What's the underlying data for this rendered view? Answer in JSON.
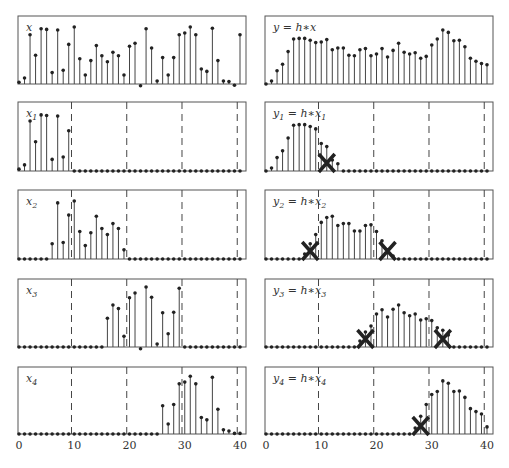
{
  "figure": {
    "x_ticks": [
      "0",
      "10",
      "20",
      "30",
      "40"
    ],
    "x_range": [
      0,
      40
    ],
    "block_boundaries": [
      9.5,
      19.5,
      29.5,
      39.5
    ]
  },
  "panels": {
    "left": [
      {
        "label": "x",
        "sub": ""
      },
      {
        "label": "x",
        "sub": "1"
      },
      {
        "label": "x",
        "sub": "2"
      },
      {
        "label": "x",
        "sub": "3"
      },
      {
        "label": "x",
        "sub": "4"
      }
    ],
    "right": [
      {
        "label": "y = h∗x",
        "sub": ""
      },
      {
        "label": "y",
        "sub": "1",
        "rhs": " = h∗x",
        "rhs_sub": "1"
      },
      {
        "label": "y",
        "sub": "2",
        "rhs": " = h∗x",
        "rhs_sub": "2"
      },
      {
        "label": "y",
        "sub": "3",
        "rhs": " = h∗x",
        "rhs_sub": "3"
      },
      {
        "label": "y",
        "sub": "4",
        "rhs": " = h∗x",
        "rhs_sub": "4"
      }
    ]
  },
  "chart_data": [
    {
      "type": "stem",
      "title": "x",
      "x_range": [
        0,
        40
      ],
      "values": [
        0.03,
        0.1,
        0.82,
        0.48,
        0.92,
        0.91,
        0.19,
        0.9,
        0.23,
        0.66,
        0.95,
        0.42,
        0.15,
        0.39,
        0.64,
        0.47,
        0.37,
        0.53,
        0.47,
        0.15,
        0.63,
        0.68,
        -0.03,
        0.92,
        0.6,
        0.05,
        0.44,
        0.15,
        0.44,
        0.82,
        0.85,
        0.95,
        0.82,
        0.25,
        0.21,
        0.93,
        0.39,
        0.05,
        0.04,
        -0.02,
        0.82
      ]
    },
    {
      "type": "stem",
      "title": "y = h∗x",
      "x_range": [
        0,
        40
      ],
      "values": [
        0.0,
        0.05,
        0.22,
        0.33,
        0.54,
        0.75,
        0.76,
        0.76,
        0.73,
        0.69,
        0.7,
        0.74,
        0.57,
        0.6,
        0.6,
        0.48,
        0.47,
        0.57,
        0.59,
        0.47,
        0.5,
        0.59,
        0.45,
        0.56,
        0.68,
        0.53,
        0.5,
        0.52,
        0.43,
        0.46,
        0.65,
        0.75,
        0.9,
        0.86,
        0.72,
        0.73,
        0.62,
        0.43,
        0.38,
        0.34,
        0.32
      ]
    },
    {
      "type": "stem",
      "title": "x1",
      "boundaries": [
        9.5,
        19.5,
        29.5,
        39.5
      ],
      "values": [
        0.03,
        0.1,
        0.82,
        0.48,
        0.92,
        0.91,
        0.19,
        0.9,
        0.23,
        0.66,
        0,
        0,
        0,
        0,
        0,
        0,
        0,
        0,
        0,
        0,
        0,
        0,
        0,
        0,
        0,
        0,
        0,
        0,
        0,
        0,
        0,
        0,
        0,
        0,
        0,
        0,
        0,
        0,
        0,
        0,
        0
      ]
    },
    {
      "type": "stem",
      "title": "y1 = h∗x1",
      "crossed": [
        11
      ],
      "values": [
        0.0,
        0.05,
        0.22,
        0.33,
        0.54,
        0.75,
        0.76,
        0.76,
        0.73,
        0.69,
        0.45,
        0.4,
        0.18,
        0.12,
        0,
        0,
        0,
        0,
        0,
        0,
        0,
        0,
        0,
        0,
        0,
        0,
        0,
        0,
        0,
        0,
        0,
        0,
        0,
        0,
        0,
        0,
        0,
        0,
        0,
        0,
        0
      ]
    },
    {
      "type": "stem",
      "title": "x2",
      "boundaries": [
        9.5,
        19.5,
        29.5,
        39.5
      ],
      "values": [
        0,
        0,
        0,
        0,
        0,
        0,
        0.25,
        0.92,
        0.27,
        0.72,
        0.95,
        0.45,
        0.22,
        0.43,
        0.7,
        0.5,
        0.4,
        0.58,
        0.5,
        0.15,
        0,
        0,
        0,
        0,
        0,
        0,
        0,
        0,
        0,
        0,
        0,
        0,
        0,
        0,
        0,
        0,
        0,
        0,
        0,
        0,
        0
      ]
    },
    {
      "type": "stem",
      "title": "y2 = h∗x2",
      "crossed": [
        8,
        22
      ],
      "values": [
        0,
        0,
        0,
        0,
        0,
        0,
        0,
        0.08,
        0.25,
        0.4,
        0.6,
        0.68,
        0.7,
        0.55,
        0.58,
        0.58,
        0.46,
        0.46,
        0.55,
        0.56,
        0.45,
        0.3,
        0.15,
        0.05,
        0,
        0,
        0,
        0,
        0,
        0,
        0,
        0,
        0,
        0,
        0,
        0,
        0,
        0,
        0,
        0,
        0
      ]
    },
    {
      "type": "stem",
      "title": "x3",
      "boundaries": [
        9.5,
        19.5,
        29.5,
        39.5
      ],
      "values": [
        0,
        0,
        0,
        0,
        0,
        0,
        0,
        0,
        0,
        0,
        0,
        0,
        0,
        0,
        0,
        0,
        0.48,
        0.7,
        0.64,
        0.18,
        0.82,
        0.9,
        -0.03,
        1.0,
        0.83,
        0.05,
        0.57,
        0.22,
        0.58,
        0.98,
        0,
        0,
        0,
        0,
        0,
        0,
        0,
        0,
        0,
        0,
        0
      ]
    },
    {
      "type": "stem",
      "title": "y3 = h∗x3",
      "crossed": [
        18,
        32
      ],
      "values": [
        0,
        0,
        0,
        0,
        0,
        0,
        0,
        0,
        0,
        0,
        0,
        0,
        0,
        0,
        0,
        0,
        0,
        0.1,
        0.25,
        0.35,
        0.55,
        0.62,
        0.5,
        0.63,
        0.7,
        0.57,
        0.52,
        0.55,
        0.45,
        0.47,
        0.44,
        0.32,
        0.28,
        0.2,
        0,
        0,
        0,
        0,
        0,
        0,
        0
      ]
    },
    {
      "type": "stem",
      "title": "x4",
      "boundaries": [
        9.5,
        19.5,
        29.5,
        39.5
      ],
      "values": [
        0,
        0,
        0,
        0,
        0,
        0,
        0,
        0,
        0,
        0,
        0,
        0,
        0,
        0,
        0,
        0,
        0,
        0,
        0,
        0,
        0,
        0,
        0,
        0,
        0,
        0,
        0.48,
        0.17,
        0.5,
        0.85,
        0.88,
        0.98,
        0.85,
        0.28,
        0.24,
        0.96,
        0.42,
        0.07,
        0.05,
        0.01,
        0.01
      ]
    },
    {
      "type": "stem",
      "title": "y4 = h∗x4",
      "crossed": [
        28
      ],
      "values": [
        0,
        0,
        0,
        0,
        0,
        0,
        0,
        0,
        0,
        0,
        0,
        0,
        0,
        0,
        0,
        0,
        0,
        0,
        0,
        0,
        0,
        0,
        0,
        0,
        0,
        0,
        0,
        0.1,
        0.3,
        0.5,
        0.67,
        0.72,
        0.9,
        0.86,
        0.72,
        0.73,
        0.62,
        0.43,
        0.38,
        0.34,
        0.12
      ]
    }
  ]
}
